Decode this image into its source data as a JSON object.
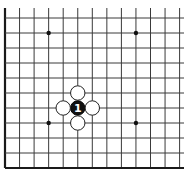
{
  "board": {
    "type": "go-diagram",
    "view": "bottom-left corner fragment",
    "columns_visible": 13,
    "rows_visible": 11,
    "colors": {
      "background": "#ffffff",
      "grid": "#3a3a3a",
      "edge": "#1a1a1a",
      "black_stone": "#111111",
      "white_stone": "#ffffff"
    },
    "star_points": [
      {
        "col": 3,
        "row": 1
      },
      {
        "col": 9,
        "row": 1
      },
      {
        "col": 3,
        "row": 7
      },
      {
        "col": 9,
        "row": 7
      }
    ],
    "stones": [
      {
        "color": "black",
        "col": 5,
        "row": 6,
        "label": "1"
      },
      {
        "color": "white",
        "col": 5,
        "row": 5,
        "label": ""
      },
      {
        "color": "white",
        "col": 4,
        "row": 6,
        "label": ""
      },
      {
        "color": "white",
        "col": 6,
        "row": 6,
        "label": ""
      },
      {
        "color": "white",
        "col": 5,
        "row": 7,
        "label": ""
      }
    ]
  }
}
